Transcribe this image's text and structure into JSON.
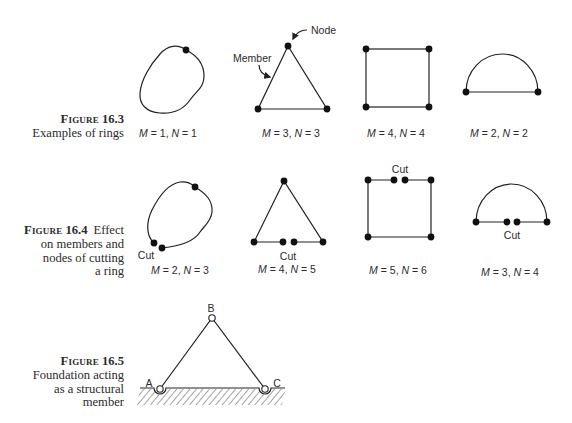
{
  "colors": {
    "line": "#222222",
    "text": "#2b2b2b",
    "background": "#ffffff"
  },
  "fig163": {
    "caption": {
      "label": "Figure",
      "number": "16.3",
      "lines": [
        "Examples of rings"
      ]
    },
    "annotations": {
      "node": "Node",
      "member": "Member"
    },
    "rings": [
      {
        "shape": "closed-curve",
        "label": [
          "M",
          " = 1, ",
          "N",
          " = 1"
        ]
      },
      {
        "shape": "triangle",
        "label": [
          "M",
          " = 3, ",
          "N",
          " = 3"
        ]
      },
      {
        "shape": "square",
        "label": [
          "M",
          " = 4, ",
          "N",
          " = 4"
        ]
      },
      {
        "shape": "semicircle",
        "label": [
          "M",
          " = 2, ",
          "N",
          " = 2"
        ]
      }
    ]
  },
  "fig164": {
    "caption": {
      "label": "Figure",
      "number": "16.4",
      "lines": [
        "Effect",
        "on members and",
        "nodes of cutting",
        "a ring"
      ]
    },
    "rings": [
      {
        "shape": "cut-closed-curve",
        "cut_label": "Cut",
        "label": [
          "M",
          " = 2, ",
          "N",
          " = 3"
        ]
      },
      {
        "shape": "cut-triangle",
        "cut_label": "Cut",
        "label": [
          "M",
          " = 4, ",
          "N",
          " = 5"
        ]
      },
      {
        "shape": "cut-square",
        "cut_label": "Cut",
        "label": [
          "M",
          " = 5, ",
          "N",
          " = 6"
        ]
      },
      {
        "shape": "cut-semicircle",
        "cut_label": "Cut",
        "label": [
          "M",
          " = 3, ",
          "N",
          " = 4"
        ]
      }
    ]
  },
  "fig165": {
    "caption": {
      "label": "Figure",
      "number": "16.5",
      "lines": [
        "Foundation acting",
        "as a structural",
        "member"
      ]
    },
    "nodes": {
      "a": "A",
      "b": "B",
      "c": "C"
    }
  }
}
